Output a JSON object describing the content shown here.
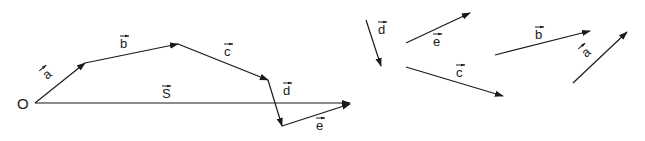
{
  "diagram": {
    "origin_label": "O",
    "colors": {
      "stroke": "#1a1a1a",
      "background": "#ffffff"
    },
    "chain": [
      {
        "name": "a",
        "label": "a",
        "x1": 35,
        "y1": 103,
        "x2": 85,
        "y2": 63,
        "lx": 47,
        "ly": 80,
        "rot": -40
      },
      {
        "name": "b",
        "label": "b",
        "x1": 85,
        "y1": 63,
        "x2": 178,
        "y2": 44,
        "lx": 120,
        "ly": 48,
        "rot": 0
      },
      {
        "name": "c",
        "label": "c",
        "x1": 178,
        "y1": 44,
        "x2": 268,
        "y2": 80,
        "lx": 224,
        "ly": 56,
        "rot": 0
      },
      {
        "name": "d",
        "label": "d",
        "x1": 268,
        "y1": 80,
        "x2": 282,
        "y2": 126,
        "lx": 283,
        "ly": 95,
        "rot": 0
      },
      {
        "name": "e",
        "label": "e",
        "x1": 282,
        "y1": 126,
        "x2": 350,
        "y2": 104,
        "lx": 316,
        "ly": 130,
        "rot": 0
      }
    ],
    "resultant": {
      "name": "S",
      "label": "S",
      "x1": 35,
      "y1": 103,
      "x2": 350,
      "y2": 103,
      "lx": 162,
      "ly": 98
    },
    "free_vectors": [
      {
        "name": "d",
        "label": "d",
        "x1": 366,
        "y1": 20,
        "x2": 381,
        "y2": 66,
        "lx": 378,
        "ly": 34,
        "rot": 0
      },
      {
        "name": "e",
        "label": "e",
        "x1": 406,
        "y1": 43,
        "x2": 470,
        "y2": 13,
        "lx": 433,
        "ly": 46,
        "rot": 0
      },
      {
        "name": "c",
        "label": "c",
        "x1": 406,
        "y1": 67,
        "x2": 503,
        "y2": 96,
        "lx": 456,
        "ly": 77,
        "rot": 0
      },
      {
        "name": "b",
        "label": "b",
        "x1": 495,
        "y1": 55,
        "x2": 590,
        "y2": 31,
        "lx": 535,
        "ly": 39,
        "rot": 0
      },
      {
        "name": "a",
        "label": "a",
        "x1": 573,
        "y1": 83,
        "x2": 627,
        "y2": 32,
        "lx": 586,
        "ly": 58,
        "rot": -40
      }
    ]
  }
}
